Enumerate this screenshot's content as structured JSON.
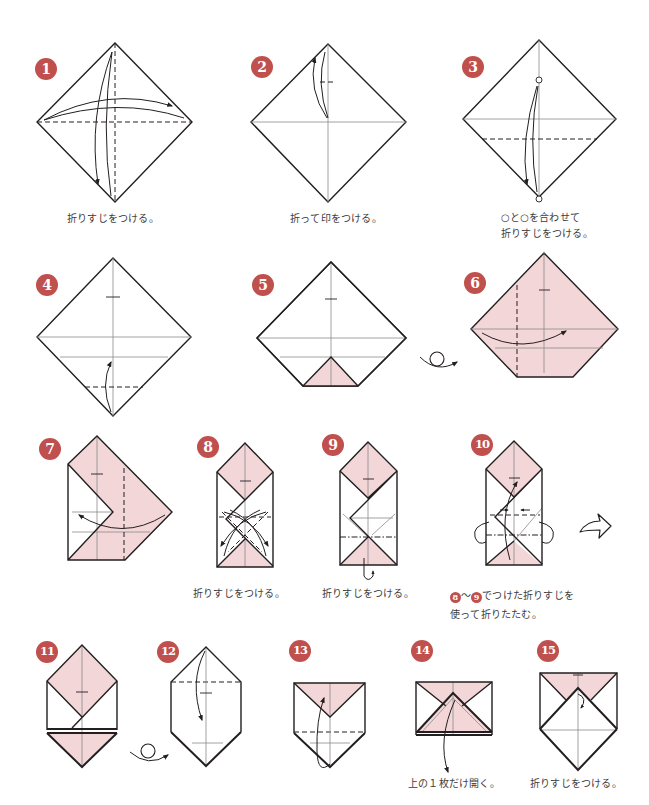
{
  "colors": {
    "badge": "#c0504d",
    "paper_colored_side": "#f2d6d8",
    "paper_white_side": "#ffffff",
    "line": "#231f20",
    "crease": "#8c8c8c",
    "caption_text": "#3c3c3c"
  },
  "steps": [
    {
      "number": "1",
      "caption": "折りすじをつける。"
    },
    {
      "number": "2",
      "caption": "折って印をつける。"
    },
    {
      "number": "3",
      "caption_line1": "○と○を合わせて",
      "caption_line2": "折りすじをつける。"
    },
    {
      "number": "4"
    },
    {
      "number": "5"
    },
    {
      "number": "6"
    },
    {
      "number": "7"
    },
    {
      "number": "8",
      "caption": "折りすじをつける。"
    },
    {
      "number": "9",
      "caption": "折りすじをつける。"
    },
    {
      "number": "10",
      "caption_ref_from": "8",
      "caption_tilde": "〜",
      "caption_ref_to": "9",
      "caption_line1_rest": "でつけた折りすじを",
      "caption_line2": "使って折りたたむ。"
    },
    {
      "number": "11"
    },
    {
      "number": "12"
    },
    {
      "number": "13"
    },
    {
      "number": "14",
      "caption": "上の１枚だけ開く。"
    },
    {
      "number": "15",
      "caption": "折りすじをつける。"
    }
  ],
  "icons": {
    "turn_over_after_step_5": "turn-over-icon",
    "turn_over_after_step_11": "turn-over-icon",
    "next_view_after_step_10": "hollow-next-arrow-icon",
    "fold_arrow": "fold-arrow-icon",
    "valley_fold_line": "valley-fold-line",
    "mountain_fold_line": "mountain-fold-line"
  }
}
